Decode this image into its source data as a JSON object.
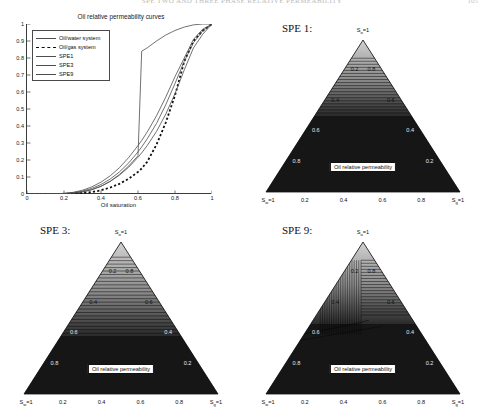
{
  "header": {
    "running_title": "SPE TWO AND THREE PHASE RELATIVE PERMEABILITY",
    "page_number": "105"
  },
  "line_chart": {
    "title": "Oil relative permeability curves",
    "xlabel": "Oil saturation",
    "ylabel": "",
    "xticks": [
      "0",
      "0.2",
      "0.4",
      "0.6",
      "0.8",
      "1"
    ],
    "yticks": [
      "0",
      "0.1",
      "0.2",
      "0.3",
      "0.4",
      "0.5",
      "0.6",
      "0.7",
      "0.8",
      "0.9",
      "1"
    ],
    "legend": [
      {
        "label": "Oil/water system",
        "style": "solid"
      },
      {
        "label": "Oil/gas system",
        "style": "dashed"
      },
      {
        "label": "SPE1",
        "style": "solid"
      },
      {
        "label": "SPE3",
        "style": "solid"
      },
      {
        "label": "SPE9",
        "style": "solid"
      }
    ]
  },
  "panels": {
    "spe1": {
      "title": "SPE 1:",
      "colorbar_label": "Oil relative permeability",
      "apex_label_prefix": "S",
      "apex_label_sub": "o",
      "apex_label_suffix": "=1",
      "left_label_prefix": "S",
      "left_label_sub": "w",
      "left_label_suffix": "=1",
      "right_label_prefix": "S",
      "right_label_sub": "g",
      "right_label_suffix": "=1"
    },
    "spe3": {
      "title": "SPE 3:",
      "colorbar_label": "Oil relative permeability",
      "apex_label_prefix": "S",
      "apex_label_sub": "o",
      "apex_label_suffix": "=1",
      "left_label_prefix": "S",
      "left_label_sub": "w",
      "left_label_suffix": "=1",
      "right_label_prefix": "S",
      "right_label_sub": "g",
      "right_label_suffix": "=1"
    },
    "spe9": {
      "title": "SPE 9:",
      "colorbar_label": "Oil relative permeability",
      "apex_label_prefix": "S",
      "apex_label_sub": "o",
      "apex_label_suffix": "=1",
      "left_label_prefix": "S",
      "left_label_sub": "w",
      "left_label_suffix": "=1",
      "right_label_prefix": "S",
      "right_label_sub": "g",
      "right_label_suffix": "=1"
    }
  },
  "ternary_axis_ticks": {
    "left": [
      "0.2",
      "0.4",
      "0.6",
      "0.8"
    ],
    "right": [
      "0.8",
      "0.6",
      "0.4",
      "0.2"
    ],
    "bottom": [
      "0.2",
      "0.4",
      "0.6",
      "0.8"
    ]
  },
  "colors": {
    "axis": "#3b3b3b",
    "curve": "#4e4e4e",
    "curve_dashed": "#111111",
    "tern_light": "#d8d8d8",
    "tern_dark": "#2a2a2a",
    "tern_darkest": "#161616"
  },
  "chart_data": {
    "type": "line",
    "title": "Oil relative permeability curves",
    "xlabel": "Oil saturation",
    "ylabel": "",
    "xlim": [
      0,
      1
    ],
    "ylim": [
      0,
      1
    ],
    "grid": false,
    "legend_position": "upper-left",
    "x": [
      0,
      0.05,
      0.1,
      0.15,
      0.2,
      0.25,
      0.3,
      0.35,
      0.4,
      0.45,
      0.5,
      0.55,
      0.6,
      0.62,
      0.65,
      0.7,
      0.75,
      0.8,
      0.85,
      0.9,
      0.95,
      1
    ],
    "series": [
      {
        "name": "Oil/water system",
        "style": "solid",
        "values": [
          0,
          0,
          0,
          0,
          0.002,
          0.005,
          0.012,
          0.025,
          0.045,
          0.075,
          0.115,
          0.165,
          0.225,
          0.84,
          0.86,
          0.9,
          0.935,
          0.962,
          0.982,
          0.995,
          1,
          1
        ]
      },
      {
        "name": "Oil/gas system",
        "style": "dashed",
        "values": [
          0,
          0,
          0,
          0,
          0,
          0.002,
          0.005,
          0.011,
          0.022,
          0.038,
          0.06,
          0.09,
          0.13,
          0.15,
          0.19,
          0.29,
          0.42,
          0.58,
          0.78,
          0.9,
          0.96,
          1
        ]
      },
      {
        "name": "SPE1",
        "style": "solid",
        "values": [
          0,
          0,
          0,
          0.001,
          0.004,
          0.01,
          0.022,
          0.042,
          0.07,
          0.107,
          0.155,
          0.215,
          0.285,
          0.315,
          0.365,
          0.46,
          0.57,
          0.69,
          0.8,
          0.91,
          0.97,
          1
        ]
      },
      {
        "name": "SPE3",
        "style": "solid",
        "values": [
          0,
          0,
          0,
          0.001,
          0.003,
          0.008,
          0.017,
          0.033,
          0.056,
          0.088,
          0.13,
          0.183,
          0.248,
          0.277,
          0.325,
          0.415,
          0.525,
          0.65,
          0.78,
          0.89,
          0.96,
          1
        ]
      },
      {
        "name": "SPE9",
        "style": "solid",
        "values": [
          0,
          0,
          0,
          0,
          0.002,
          0.006,
          0.013,
          0.026,
          0.046,
          0.074,
          0.111,
          0.158,
          0.216,
          0.242,
          0.285,
          0.368,
          0.47,
          0.59,
          0.73,
          0.86,
          0.94,
          1
        ]
      }
    ]
  }
}
